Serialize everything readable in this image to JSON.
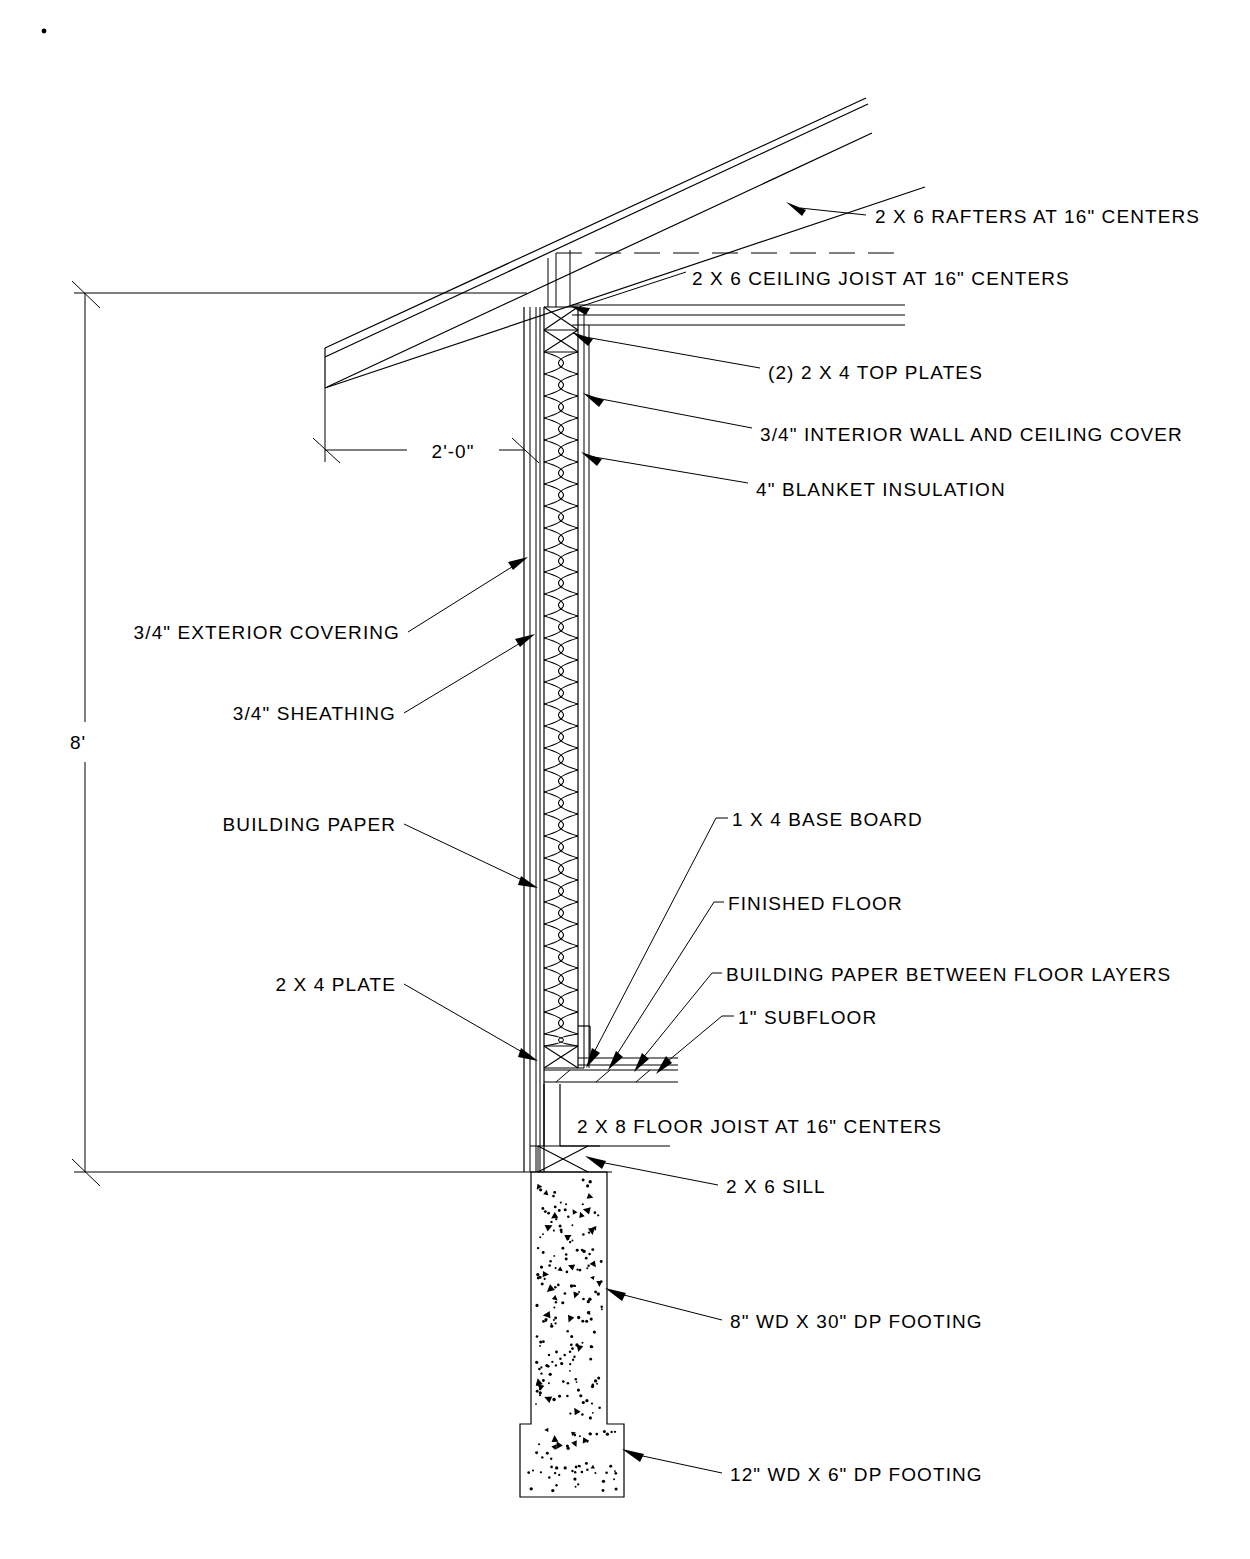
{
  "drawing": {
    "title": "Exterior Wall Section Detail",
    "dimensions": {
      "wall_height": "8'",
      "eave_overhang": "2'-0\""
    },
    "annotations": {
      "rafters": "2 X 6 RAFTERS AT 16\" CENTERS",
      "ceiling_joist": "2 X 6 CEILING JOIST AT 16\" CENTERS",
      "top_plates": "(2) 2 X 4 TOP PLATES",
      "interior_cover": "3/4\" INTERIOR WALL AND CEILING COVER",
      "blanket_insulation": "4\" BLANKET INSULATION",
      "exterior_covering": "3/4\" EXTERIOR COVERING",
      "sheathing": "3/4\" SHEATHING",
      "building_paper": "BUILDING PAPER",
      "base_board": "1 X 4 BASE BOARD",
      "finished_floor": "FINISHED FLOOR",
      "building_paper_floor": "BUILDING PAPER BETWEEN FLOOR LAYERS",
      "subfloor": "1\" SUBFLOOR",
      "bottom_plate": "2 X 4 PLATE",
      "floor_joist": "2 X 8 FLOOR JOIST AT 16\" CENTERS",
      "sill": "2 X 6 SILL",
      "foundation_wall": "8\" WD X 30\" DP FOOTING",
      "footing": "12\" WD X 6\" DP FOOTING"
    },
    "colors": {
      "line": "#000000",
      "background": "#ffffff"
    }
  }
}
